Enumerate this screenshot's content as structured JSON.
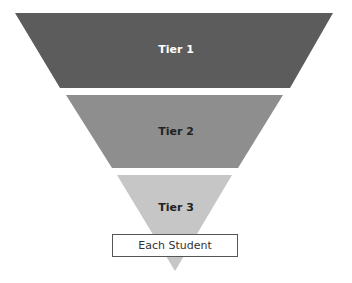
{
  "diagram": {
    "type": "inverted-pyramid",
    "tiers": [
      {
        "label": "Tier 1",
        "fill": "#5c5c5c",
        "text_color": "#ffffff"
      },
      {
        "label": "Tier 2",
        "fill": "#8e8e8e",
        "text_color": "#222222"
      },
      {
        "label": "Tier 3",
        "fill": "#c6c6c6",
        "text_color": "#222222"
      }
    ],
    "base": {
      "label": "Each Student",
      "border_color": "#555555"
    }
  }
}
